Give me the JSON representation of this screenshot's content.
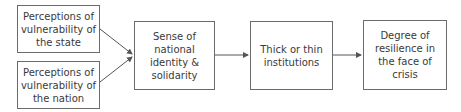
{
  "diagram": {
    "nodes": [
      {
        "id": "vuln-state",
        "label": "Perceptions of vulnerability of the state"
      },
      {
        "id": "vuln-nation",
        "label": "Perceptions of vulnerability of the nation"
      },
      {
        "id": "identity",
        "label": "Sense of national identity & solidarity"
      },
      {
        "id": "institutions",
        "label": "Thick or thin institutions"
      },
      {
        "id": "resilience",
        "label": "Degree of resilience in the face of crisis"
      }
    ],
    "edges": [
      {
        "from": "vuln-state",
        "to": "identity"
      },
      {
        "from": "vuln-nation",
        "to": "identity"
      },
      {
        "from": "identity",
        "to": "institutions"
      },
      {
        "from": "institutions",
        "to": "resilience"
      }
    ],
    "colors": {
      "border": "#6b6b6b",
      "text": "#3a3a3a",
      "arrow": "#555555"
    }
  }
}
